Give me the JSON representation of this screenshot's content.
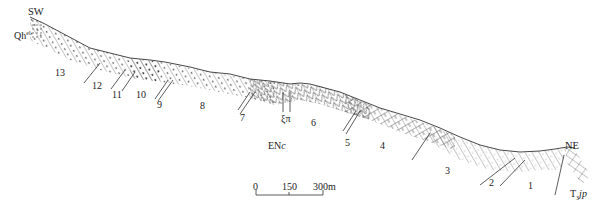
{
  "diagram": {
    "type": "geological-cross-section",
    "orientation": {
      "left": "SW",
      "right": "NE"
    },
    "unit_labels": {
      "qh": "Qh",
      "qh_sup": "el",
      "enc_main": "EN",
      "enc_italic": "c",
      "xipi": "ξπ",
      "t3jp_main": "T",
      "t3jp_sub": "3",
      "t3jp_italic": "jp"
    },
    "layers": [
      {
        "id": "13",
        "label": "13"
      },
      {
        "id": "12",
        "label": "12"
      },
      {
        "id": "11",
        "label": "11"
      },
      {
        "id": "10",
        "label": "10"
      },
      {
        "id": "9",
        "label": "9"
      },
      {
        "id": "8",
        "label": "8"
      },
      {
        "id": "7",
        "label": "7"
      },
      {
        "id": "6",
        "label": "6"
      },
      {
        "id": "5",
        "label": "5"
      },
      {
        "id": "4",
        "label": "4"
      },
      {
        "id": "3",
        "label": "3"
      },
      {
        "id": "2",
        "label": "2"
      },
      {
        "id": "1",
        "label": "1"
      }
    ],
    "scale_bar": {
      "ticks": [
        "0",
        "150",
        "300m"
      ]
    },
    "colors": {
      "line": "#333333",
      "text": "#222222",
      "background": "#ffffff"
    }
  }
}
